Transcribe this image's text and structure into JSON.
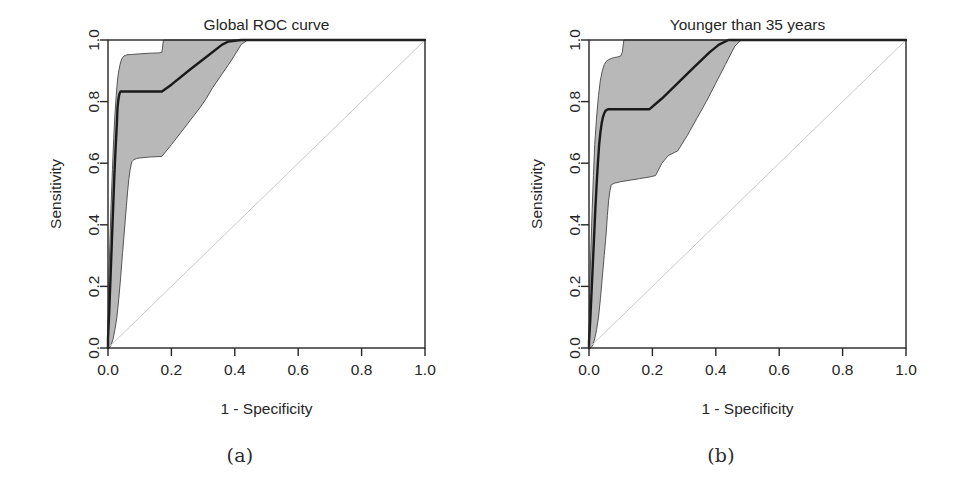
{
  "figure": {
    "background": "#ffffff",
    "panels": [
      {
        "id": "a",
        "subcaption": "(a)",
        "chart": {
          "type": "line",
          "title": "Global ROC curve",
          "xlabel": "1 - Specificity",
          "ylabel": "Sensitivity",
          "xlim": [
            0.0,
            1.0
          ],
          "ylim": [
            0.0,
            1.0
          ],
          "xticks": [
            "0.0",
            "0.2",
            "0.4",
            "0.6",
            "0.8",
            "1.0"
          ],
          "yticks": [
            "0.0",
            "0.2",
            "0.4",
            "0.6",
            "0.8",
            "1.0"
          ],
          "grid": false,
          "legend": null,
          "colors": {
            "curve": "#1a1a1a",
            "band_fill": "#b8b8b8",
            "band_edge": "#555555",
            "diagonal": "#c9c9c9",
            "axis": "#262626"
          },
          "series": [
            {
              "name": "ROC curve",
              "role": "estimate",
              "x": [
                0.0,
                0.0,
                0.004,
                0.008,
                0.012,
                0.016,
                0.02,
                0.024,
                0.028,
                0.03,
                0.032,
                0.034,
                0.036,
                0.038,
                0.04,
                0.04,
                0.17,
                0.2,
                0.26,
                0.31,
                0.36,
                0.38,
                0.42,
                0.45,
                1.0
              ],
              "y": [
                0.0,
                0.03,
                0.12,
                0.23,
                0.34,
                0.45,
                0.56,
                0.65,
                0.73,
                0.78,
                0.8,
                0.815,
                0.825,
                0.83,
                0.833,
                0.833,
                0.833,
                0.855,
                0.905,
                0.945,
                0.985,
                0.995,
                1.0,
                1.0,
                1.0
              ]
            },
            {
              "name": "Upper confidence bound",
              "role": "band_upper",
              "x": [
                0.0,
                0.002,
                0.006,
                0.01,
                0.014,
                0.018,
                0.022,
                0.026,
                0.03,
                0.034,
                0.038,
                0.042,
                0.046,
                0.05,
                0.055,
                0.06,
                0.075,
                0.1,
                0.13,
                0.16,
                0.17,
                0.175,
                0.2,
                0.26,
                0.31,
                0.36,
                0.42,
                1.0
              ],
              "y": [
                0.04,
                0.2,
                0.34,
                0.47,
                0.58,
                0.68,
                0.76,
                0.82,
                0.87,
                0.9,
                0.92,
                0.935,
                0.943,
                0.948,
                0.95,
                0.952,
                0.953,
                0.955,
                0.957,
                0.958,
                0.96,
                1.0,
                1.0,
                1.0,
                1.0,
                1.0,
                1.0,
                1.0
              ]
            },
            {
              "name": "Lower confidence bound",
              "role": "band_lower",
              "x": [
                0.0,
                0.004,
                0.01,
                0.016,
                0.022,
                0.028,
                0.034,
                0.04,
                0.046,
                0.05,
                0.054,
                0.058,
                0.062,
                0.066,
                0.07,
                0.075,
                0.08,
                0.085,
                0.09,
                0.1,
                0.13,
                0.17,
                0.2,
                0.23,
                0.26,
                0.29,
                0.31,
                0.33,
                0.36,
                0.39,
                0.42,
                0.44,
                1.0
              ],
              "y": [
                0.0,
                0.0,
                0.01,
                0.03,
                0.06,
                0.1,
                0.16,
                0.23,
                0.31,
                0.36,
                0.41,
                0.46,
                0.51,
                0.55,
                0.58,
                0.605,
                0.61,
                0.613,
                0.615,
                0.617,
                0.62,
                0.622,
                0.66,
                0.7,
                0.74,
                0.78,
                0.81,
                0.845,
                0.89,
                0.935,
                0.985,
                1.0,
                1.0
              ]
            },
            {
              "name": "Chance diagonal",
              "role": "reference",
              "x": [
                0.0,
                1.0
              ],
              "y": [
                0.0,
                1.0
              ]
            }
          ]
        }
      },
      {
        "id": "b",
        "subcaption": "(b)",
        "chart": {
          "type": "line",
          "title": "Younger than 35 years",
          "xlabel": "1 - Specificity",
          "ylabel": "Sensitivity",
          "xlim": [
            0.0,
            1.0
          ],
          "ylim": [
            0.0,
            1.0
          ],
          "xticks": [
            "0.0",
            "0.2",
            "0.4",
            "0.6",
            "0.8",
            "1.0"
          ],
          "yticks": [
            "0.0",
            "0.2",
            "0.4",
            "0.6",
            "0.8",
            "1.0"
          ],
          "grid": false,
          "legend": null,
          "colors": {
            "curve": "#1a1a1a",
            "band_fill": "#b8b8b8",
            "band_edge": "#555555",
            "diagonal": "#c9c9c9",
            "axis": "#262626"
          },
          "series": [
            {
              "name": "ROC curve",
              "role": "estimate",
              "x": [
                0.0,
                0.0,
                0.004,
                0.008,
                0.012,
                0.016,
                0.02,
                0.024,
                0.028,
                0.032,
                0.036,
                0.04,
                0.044,
                0.048,
                0.052,
                0.056,
                0.06,
                0.19,
                0.23,
                0.28,
                0.33,
                0.38,
                0.41,
                0.44,
                0.47,
                1.0
              ],
              "y": [
                0.0,
                0.02,
                0.09,
                0.18,
                0.27,
                0.36,
                0.45,
                0.53,
                0.6,
                0.66,
                0.7,
                0.73,
                0.75,
                0.762,
                0.77,
                0.773,
                0.775,
                0.775,
                0.81,
                0.86,
                0.91,
                0.96,
                0.985,
                1.0,
                1.0,
                1.0
              ]
            },
            {
              "name": "Upper confidence bound",
              "role": "band_upper",
              "x": [
                0.0,
                0.002,
                0.006,
                0.01,
                0.014,
                0.018,
                0.024,
                0.03,
                0.036,
                0.042,
                0.048,
                0.054,
                0.06,
                0.07,
                0.08,
                0.09,
                0.1,
                0.105,
                0.11,
                0.19,
                0.28,
                0.38,
                0.44,
                1.0
              ],
              "y": [
                0.03,
                0.18,
                0.32,
                0.45,
                0.56,
                0.66,
                0.75,
                0.82,
                0.87,
                0.9,
                0.92,
                0.93,
                0.935,
                0.94,
                0.943,
                0.945,
                0.948,
                0.96,
                1.0,
                1.0,
                1.0,
                1.0,
                1.0,
                1.0
              ]
            },
            {
              "name": "Lower confidence bound",
              "role": "band_lower",
              "x": [
                0.0,
                0.006,
                0.012,
                0.018,
                0.024,
                0.03,
                0.036,
                0.042,
                0.048,
                0.054,
                0.058,
                0.062,
                0.066,
                0.07,
                0.08,
                0.1,
                0.13,
                0.16,
                0.19,
                0.21,
                0.23,
                0.25,
                0.27,
                0.28,
                0.31,
                0.34,
                0.37,
                0.4,
                0.43,
                0.46,
                0.48,
                1.0
              ],
              "y": [
                0.0,
                0.0,
                0.01,
                0.03,
                0.06,
                0.1,
                0.16,
                0.23,
                0.3,
                0.37,
                0.43,
                0.48,
                0.51,
                0.53,
                0.535,
                0.54,
                0.545,
                0.55,
                0.555,
                0.56,
                0.6,
                0.625,
                0.635,
                0.64,
                0.69,
                0.745,
                0.8,
                0.86,
                0.92,
                0.98,
                1.0,
                1.0
              ]
            },
            {
              "name": "Chance diagonal",
              "role": "reference",
              "x": [
                0.0,
                1.0
              ],
              "y": [
                0.0,
                1.0
              ]
            }
          ]
        }
      }
    ]
  }
}
